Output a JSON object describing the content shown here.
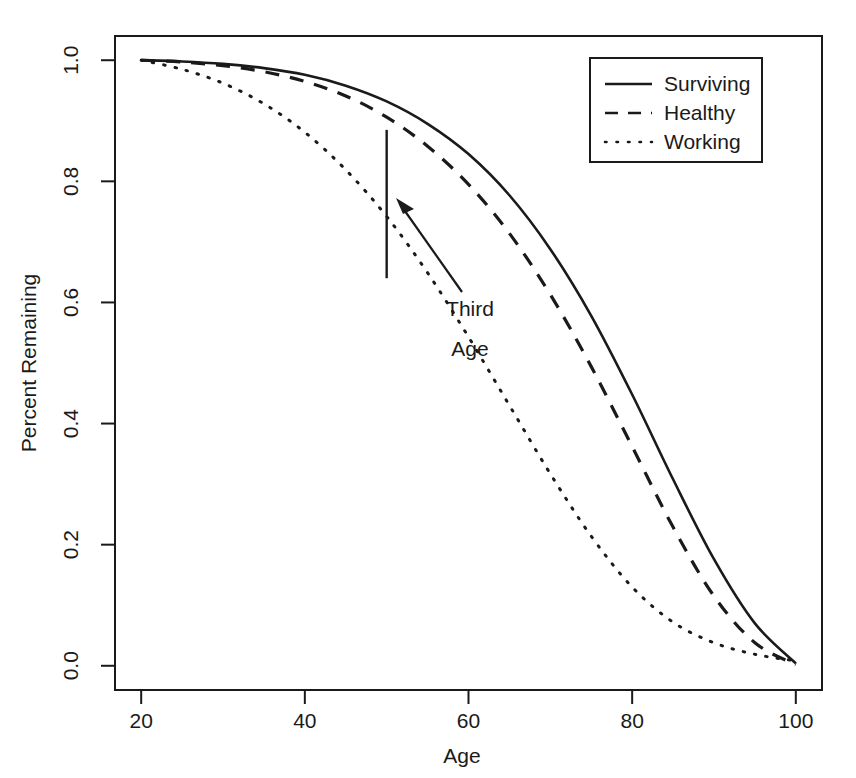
{
  "chart_data": {
    "type": "line",
    "title": "",
    "xlabel": "Age",
    "ylabel": "Percent Remaining",
    "xlim": [
      20,
      100
    ],
    "ylim": [
      0.0,
      1.0
    ],
    "grid": false,
    "legend_position": "top-right",
    "xticks": [
      20,
      40,
      60,
      80,
      100
    ],
    "xtick_labels": [
      "20",
      "40",
      "60",
      "80",
      "100"
    ],
    "yticks": [
      0.0,
      0.2,
      0.4,
      0.6,
      0.8,
      1.0
    ],
    "ytick_labels": [
      "0.0",
      "0.2",
      "0.4",
      "0.6",
      "0.8",
      "1.0"
    ],
    "x": [
      20,
      25,
      30,
      35,
      40,
      45,
      50,
      55,
      60,
      65,
      70,
      75,
      80,
      85,
      90,
      95,
      100
    ],
    "series": [
      {
        "name": "Surviving",
        "style": "solid",
        "values": [
          1.0,
          0.998,
          0.994,
          0.987,
          0.976,
          0.958,
          0.932,
          0.895,
          0.845,
          0.777,
          0.688,
          0.578,
          0.448,
          0.308,
          0.176,
          0.07,
          0.004
        ]
      },
      {
        "name": "Healthy",
        "style": "dashed",
        "values": [
          1.0,
          0.997,
          0.991,
          0.981,
          0.965,
          0.941,
          0.906,
          0.858,
          0.795,
          0.714,
          0.613,
          0.494,
          0.362,
          0.229,
          0.115,
          0.038,
          0.002
        ]
      },
      {
        "name": "Working",
        "style": "dotted",
        "values": [
          1.0,
          0.985,
          0.962,
          0.928,
          0.881,
          0.819,
          0.742,
          0.649,
          0.543,
          0.43,
          0.317,
          0.214,
          0.13,
          0.072,
          0.038,
          0.019,
          0.008
        ]
      }
    ],
    "annotations": [
      {
        "name": "third-age-marker",
        "label_line1": "Third",
        "label_line2": "Age",
        "x": 50,
        "y_top": 0.885,
        "y_bottom": 0.64
      }
    ]
  },
  "legend": {
    "entries": [
      {
        "label": "Surviving",
        "style": "solid"
      },
      {
        "label": "Healthy",
        "style": "dashed"
      },
      {
        "label": "Working",
        "style": "dotted"
      }
    ]
  },
  "annotation": {
    "third_age_line1": "Third",
    "third_age_line2": "Age"
  },
  "colors": {
    "ink": "#1a1a1a",
    "background": "#ffffff"
  }
}
